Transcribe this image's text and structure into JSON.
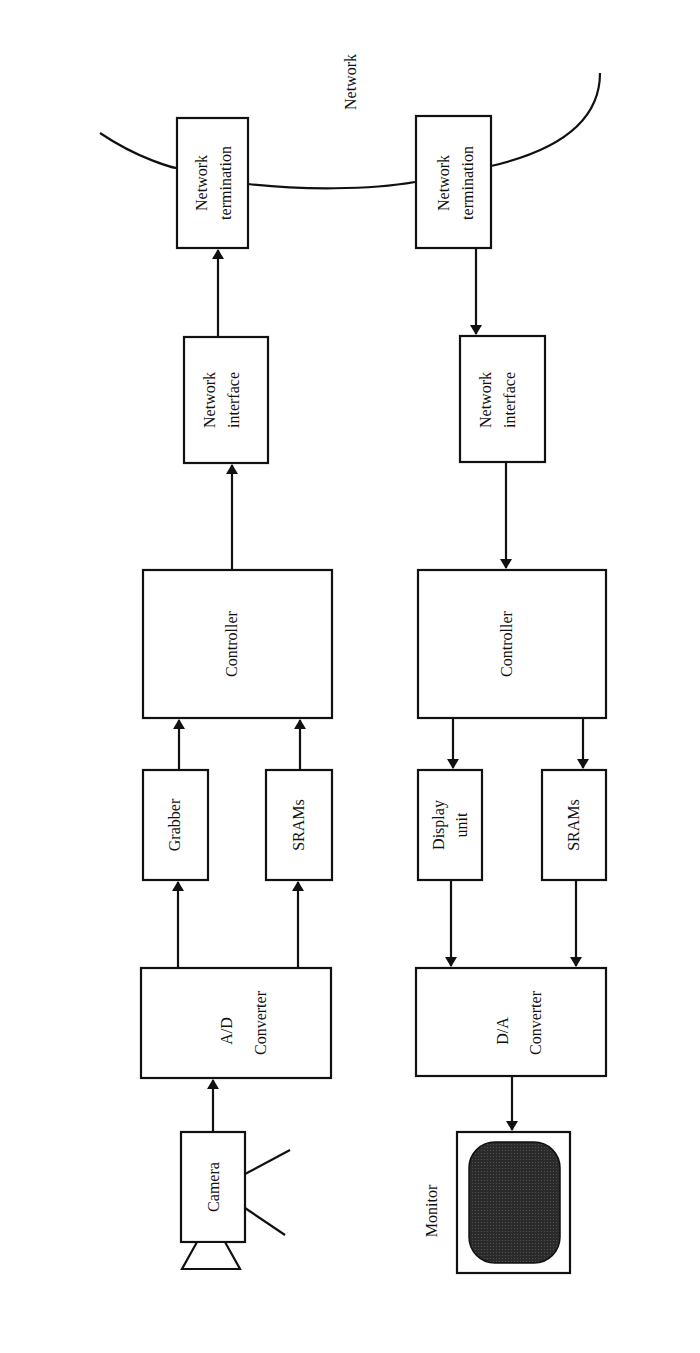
{
  "diagram": {
    "orientation": "rotated-90-ccw",
    "network": {
      "label": "Network"
    },
    "transmit_chain": {
      "network_termination": {
        "line1": "Network",
        "line2": "termination"
      },
      "network_interface": {
        "line1": "Network",
        "line2": "interface"
      },
      "controller": {
        "label": "Controller"
      },
      "grabber": {
        "label": "Grabber"
      },
      "srams": {
        "label": "SRAMs"
      },
      "converter": {
        "line1": "A/D",
        "line2": "Converter"
      },
      "camera": {
        "label": "Camera"
      }
    },
    "receive_chain": {
      "network_termination": {
        "line1": "Network",
        "line2": "termination"
      },
      "network_interface": {
        "line1": "Network",
        "line2": "interface"
      },
      "controller": {
        "label": "Controller"
      },
      "display_unit": {
        "line1": "Display",
        "line2": "unit"
      },
      "srams": {
        "label": "SRAMs"
      },
      "converter": {
        "line1": "D/A",
        "line2": "Converter"
      },
      "monitor": {
        "label": "Monitor"
      }
    },
    "edges": [
      {
        "from": "Camera",
        "to": "A/D Converter"
      },
      {
        "from": "A/D Converter",
        "to": "Grabber"
      },
      {
        "from": "A/D Converter",
        "to": "SRAMs"
      },
      {
        "from": "Grabber",
        "to": "Controller"
      },
      {
        "from": "SRAMs",
        "to": "Controller"
      },
      {
        "from": "Controller",
        "to": "Network interface"
      },
      {
        "from": "Network interface",
        "to": "Network termination"
      },
      {
        "from": "Network termination",
        "to": "Network"
      },
      {
        "from": "Network",
        "to": "Network termination (rx)"
      },
      {
        "from": "Network termination (rx)",
        "to": "Network interface (rx)"
      },
      {
        "from": "Network interface (rx)",
        "to": "Controller (rx)"
      },
      {
        "from": "Controller (rx)",
        "to": "Display unit"
      },
      {
        "from": "Controller (rx)",
        "to": "SRAMs (rx)"
      },
      {
        "from": "Display unit",
        "to": "D/A Converter"
      },
      {
        "from": "SRAMs (rx)",
        "to": "D/A Converter"
      },
      {
        "from": "D/A Converter",
        "to": "Monitor"
      }
    ]
  }
}
